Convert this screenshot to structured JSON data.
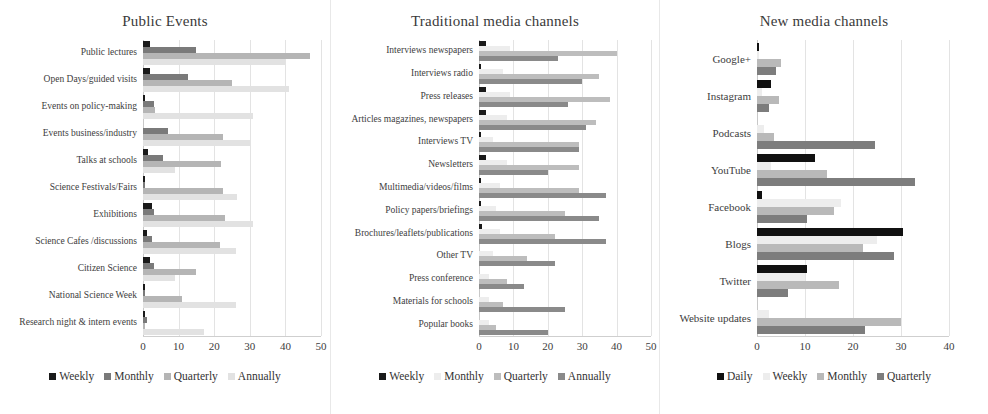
{
  "figure": {
    "panels": [
      {
        "id": "public-events",
        "title": "Public Events",
        "xlabel": "",
        "xticks": [
          "0",
          "10",
          "20",
          "30",
          "40",
          "50"
        ],
        "xmin": 0,
        "xmax": 50,
        "legend": [
          {
            "label": "Weekly",
            "color": "#1a1a1a"
          },
          {
            "label": "Monthly",
            "color": "#7a7a7a"
          },
          {
            "label": "Quarterly",
            "color": "#b5b5b5"
          },
          {
            "label": "Annually",
            "color": "#e2e2e2"
          }
        ],
        "categories": [
          "Public lectures",
          "Open Days/guided visits",
          "Events on policy-making",
          "Events business/industry",
          "Talks at schools",
          "Science Festivals/Fairs",
          "Exhibitions",
          "Science Cafes /discussions",
          "Citizen Science",
          "National Science Week",
          "Research night & intern events"
        ],
        "series": [
          {
            "name": "Weekly",
            "values": [
              2.0,
              2.0,
              0.5,
              0.0,
              1.5,
              0.5,
              2.5,
              1.0,
              2.0,
              0.5,
              0.5
            ]
          },
          {
            "name": "Monthly",
            "values": [
              15.0,
              12.5,
              3.0,
              7.0,
              5.5,
              0.5,
              3.0,
              2.5,
              3.0,
              0.5,
              1.0
            ]
          },
          {
            "name": "Quarterly",
            "values": [
              47.0,
              25.0,
              3.5,
              22.5,
              22.0,
              22.5,
              23.0,
              21.5,
              15.0,
              11.0,
              0.5
            ]
          },
          {
            "name": "Annually",
            "values": [
              40.0,
              41.0,
              31.0,
              30.0,
              9.0,
              26.5,
              31.0,
              26.0,
              9.0,
              26.0,
              17.0
            ]
          }
        ]
      },
      {
        "id": "traditional-media",
        "title": "Traditional media channels",
        "xlabel": "",
        "xticks": [
          "0",
          "10",
          "20",
          "30",
          "40",
          "50"
        ],
        "xmin": 0,
        "xmax": 50,
        "legend": [
          {
            "label": "Weekly",
            "color": "#1a1a1a"
          },
          {
            "label": "Monthly",
            "color": "#ededed"
          },
          {
            "label": "Quarterly",
            "color": "#bdbdbd"
          },
          {
            "label": "Annually",
            "color": "#8a8a8a"
          }
        ],
        "categories": [
          "Interviews newspapers",
          "Interviews radio",
          "Press releases",
          "Articles magazines, newspapers",
          "Interviews TV",
          "Newsletters",
          "Multimedia/videos/films",
          "Policy papers/briefings",
          "Brochures/leaflets/publications",
          "Other TV",
          "Press conference",
          "Materials for schools",
          "Popular books"
        ],
        "series": [
          {
            "name": "Weekly",
            "values": [
              2.0,
              0.5,
              2.0,
              2.0,
              0.5,
              2.0,
              0.5,
              0.5,
              1.0,
              0.0,
              0.0,
              0.0,
              0.0
            ]
          },
          {
            "name": "Monthly",
            "values": [
              9.0,
              7.0,
              9.0,
              8.0,
              4.0,
              8.0,
              6.0,
              5.0,
              6.0,
              4.0,
              3.0,
              3.0,
              3.0
            ]
          },
          {
            "name": "Quarterly",
            "values": [
              40.0,
              35.0,
              38.0,
              34.0,
              29.0,
              29.0,
              29.0,
              25.0,
              22.0,
              14.0,
              8.0,
              7.0,
              5.0
            ]
          },
          {
            "name": "Annually",
            "values": [
              23.0,
              30.0,
              26.0,
              31.0,
              29.0,
              20.0,
              37.0,
              35.0,
              37.0,
              22.0,
              13.0,
              25.0,
              20.0
            ]
          }
        ]
      },
      {
        "id": "new-media",
        "title": "New media channels",
        "xlabel": "",
        "xticks": [
          "0",
          "10",
          "20",
          "30",
          "40"
        ],
        "xmin": 0,
        "xmax": 40,
        "legend": [
          {
            "label": "Daily",
            "color": "#111111"
          },
          {
            "label": "Weekly",
            "color": "#ededed"
          },
          {
            "label": "Monthly",
            "color": "#b9b9b9"
          },
          {
            "label": "Quarterly",
            "color": "#7d7d7d"
          }
        ],
        "categories": [
          "Google+",
          "Instagram",
          "Podcasts",
          "YouTube",
          "Facebook",
          "Blogs",
          "Twitter",
          "Website updates"
        ],
        "series": [
          {
            "name": "Daily",
            "values": [
              0.5,
              3.0,
              0.0,
              12.0,
              1.0,
              30.5,
              10.5,
              0.0
            ]
          },
          {
            "name": "Weekly",
            "values": [
              0.5,
              1.0,
              1.5,
              3.0,
              17.5,
              25.0,
              10.0,
              2.5
            ]
          },
          {
            "name": "Monthly",
            "values": [
              5.0,
              4.5,
              3.5,
              14.5,
              16.0,
              22.0,
              17.0,
              30.0
            ]
          },
          {
            "name": "Quarterly",
            "values": [
              4.0,
              2.5,
              24.5,
              33.0,
              10.5,
              28.5,
              6.5,
              22.5
            ]
          }
        ]
      }
    ]
  },
  "chart_data": [
    {
      "type": "bar",
      "orientation": "horizontal",
      "title": "Public Events",
      "xlabel": "",
      "ylabel": "",
      "xlim": [
        0,
        50
      ],
      "grid": true,
      "legend_position": "bottom",
      "categories": [
        "Public lectures",
        "Open Days/guided visits",
        "Events on policy-making",
        "Events business/industry",
        "Talks at schools",
        "Science Festivals/Fairs",
        "Exhibitions",
        "Science Cafes /discussions",
        "Citizen Science",
        "National Science Week",
        "Research night & intern events"
      ],
      "series": [
        {
          "name": "Weekly",
          "values": [
            2.0,
            2.0,
            0.5,
            0.0,
            1.5,
            0.5,
            2.5,
            1.0,
            2.0,
            0.5,
            0.5
          ]
        },
        {
          "name": "Monthly",
          "values": [
            15.0,
            12.5,
            3.0,
            7.0,
            5.5,
            0.5,
            3.0,
            2.5,
            3.0,
            0.5,
            1.0
          ]
        },
        {
          "name": "Quarterly",
          "values": [
            47.0,
            25.0,
            3.5,
            22.5,
            22.0,
            22.5,
            23.0,
            21.5,
            15.0,
            11.0,
            0.5
          ]
        },
        {
          "name": "Annually",
          "values": [
            40.0,
            41.0,
            31.0,
            30.0,
            9.0,
            26.5,
            31.0,
            26.0,
            9.0,
            26.0,
            17.0
          ]
        }
      ]
    },
    {
      "type": "bar",
      "orientation": "horizontal",
      "title": "Traditional media channels",
      "xlabel": "",
      "ylabel": "",
      "xlim": [
        0,
        50
      ],
      "grid": true,
      "legend_position": "bottom",
      "categories": [
        "Interviews newspapers",
        "Interviews radio",
        "Press releases",
        "Articles magazines, newspapers",
        "Interviews TV",
        "Newsletters",
        "Multimedia/videos/films",
        "Policy papers/briefings",
        "Brochures/leaflets/publications",
        "Other TV",
        "Press conference",
        "Materials for schools",
        "Popular books"
      ],
      "series": [
        {
          "name": "Weekly",
          "values": [
            2.0,
            0.5,
            2.0,
            2.0,
            0.5,
            2.0,
            0.5,
            0.5,
            1.0,
            0.0,
            0.0,
            0.0,
            0.0
          ]
        },
        {
          "name": "Monthly",
          "values": [
            9.0,
            7.0,
            9.0,
            8.0,
            4.0,
            8.0,
            6.0,
            5.0,
            6.0,
            4.0,
            3.0,
            3.0,
            3.0
          ]
        },
        {
          "name": "Quarterly",
          "values": [
            40.0,
            35.0,
            38.0,
            34.0,
            29.0,
            29.0,
            29.0,
            25.0,
            22.0,
            14.0,
            8.0,
            7.0,
            5.0
          ]
        },
        {
          "name": "Annually",
          "values": [
            23.0,
            30.0,
            26.0,
            31.0,
            29.0,
            20.0,
            37.0,
            35.0,
            37.0,
            22.0,
            13.0,
            25.0,
            20.0
          ]
        }
      ]
    },
    {
      "type": "bar",
      "orientation": "horizontal",
      "title": "New media channels",
      "xlabel": "",
      "ylabel": "",
      "xlim": [
        0,
        40
      ],
      "grid": true,
      "legend_position": "bottom",
      "categories": [
        "Google+",
        "Instagram",
        "Podcasts",
        "YouTube",
        "Facebook",
        "Blogs",
        "Twitter",
        "Website updates"
      ],
      "series": [
        {
          "name": "Daily",
          "values": [
            0.5,
            3.0,
            0.0,
            12.0,
            1.0,
            30.5,
            10.5,
            0.0
          ]
        },
        {
          "name": "Weekly",
          "values": [
            0.5,
            1.0,
            1.5,
            3.0,
            17.5,
            25.0,
            10.0,
            2.5
          ]
        },
        {
          "name": "Monthly",
          "values": [
            5.0,
            4.5,
            3.5,
            14.5,
            16.0,
            22.0,
            17.0,
            30.0
          ]
        },
        {
          "name": "Quarterly",
          "values": [
            4.0,
            2.5,
            24.5,
            33.0,
            10.5,
            28.5,
            6.5,
            22.5
          ]
        }
      ]
    }
  ]
}
